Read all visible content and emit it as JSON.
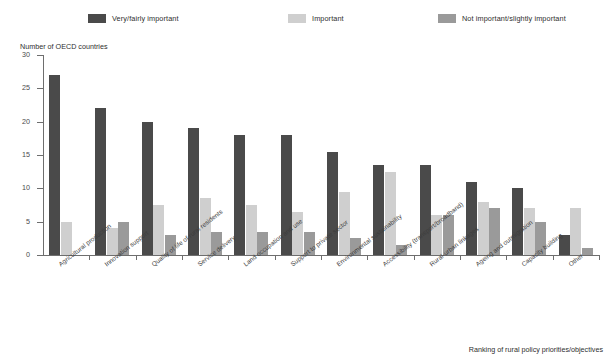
{
  "legend": {
    "items": [
      {
        "label": "Very/fairly important",
        "color": "#4a4a4a",
        "name": "legend-very-fairly-important"
      },
      {
        "label": "Important",
        "color": "#cfcfcf",
        "name": "legend-important"
      },
      {
        "label": "Not important/slightly important",
        "color": "#9a9a9a",
        "name": "legend-not-important"
      }
    ]
  },
  "axis": {
    "ylabel": "Number of OECD countries",
    "xlabel": "Ranking of rural policy priorities/objectives",
    "yticks": [
      "0",
      "5",
      "10",
      "15",
      "20",
      "25",
      "30"
    ]
  },
  "chart_data": {
    "type": "bar",
    "title": "",
    "xlabel": "Ranking of rural policy priorities/objectives",
    "ylabel": "Number of OECD countries",
    "ylim": [
      0,
      30
    ],
    "ytick_step": 5,
    "grid": false,
    "legend_position": "top",
    "categories": [
      "Agricultural production",
      "Innovation support",
      "Quality of life of rural residents",
      "Service delivery",
      "Land occupation and use",
      "Support to private sector",
      "Environmental sustainability",
      "Accessibility (transport/broadband)",
      "Rural-urban linkages",
      "Ageing and outmigration",
      "Capacity building",
      "Other"
    ],
    "series": [
      {
        "name": "Very/fairly important",
        "color": "#4a4a4a",
        "values": [
          27,
          22,
          20,
          19,
          18,
          18,
          15.5,
          13.5,
          13.5,
          11,
          10,
          3
        ]
      },
      {
        "name": "Important",
        "color": "#cfcfcf",
        "values": [
          5,
          4,
          7.5,
          8.5,
          7.5,
          6.5,
          9.5,
          12.5,
          6,
          8,
          7,
          7
        ]
      },
      {
        "name": "Not important/slightly important",
        "color": "#9a9a9a",
        "values": [
          0,
          5,
          3,
          3.5,
          3.5,
          3.5,
          2.5,
          1.5,
          6,
          7,
          5,
          1
        ]
      }
    ]
  }
}
